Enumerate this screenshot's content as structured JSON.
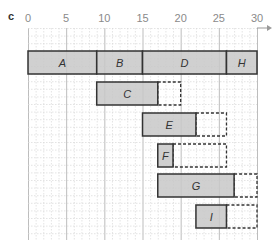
{
  "panel_label": "c",
  "chart_data": {
    "type": "gantt",
    "title": "",
    "xlabel": "",
    "ylabel": "",
    "xlim": [
      0,
      30
    ],
    "x_ticks": [
      0,
      5,
      10,
      15,
      20,
      25,
      30
    ],
    "grid": true,
    "legend": null,
    "rows": [
      {
        "tasks": [
          {
            "label": "A",
            "start": 0,
            "end": 9
          },
          {
            "label": "B",
            "start": 9,
            "end": 15
          },
          {
            "label": "D",
            "start": 15,
            "end": 26
          },
          {
            "label": "H",
            "start": 26,
            "end": 30
          }
        ]
      },
      {
        "tasks": [
          {
            "label": "C",
            "start": 9,
            "end": 17,
            "slack_end": 20
          }
        ]
      },
      {
        "tasks": [
          {
            "label": "E",
            "start": 15,
            "end": 22,
            "slack_end": 26
          }
        ]
      },
      {
        "tasks": [
          {
            "label": "F",
            "start": 17,
            "end": 19,
            "slack_end": 26
          }
        ]
      },
      {
        "tasks": [
          {
            "label": "G",
            "start": 17,
            "end": 27,
            "slack_end": 30
          }
        ]
      },
      {
        "tasks": [
          {
            "label": "I",
            "start": 22,
            "end": 26,
            "slack_end": 30
          }
        ]
      }
    ]
  },
  "colors": {
    "bar_fill": "#c8c8c8",
    "bar_stroke": "#333333",
    "grid_major": "#bdbdbd",
    "grid_minor": "#d9d9d9",
    "tick_text": "#8a8a8a"
  }
}
